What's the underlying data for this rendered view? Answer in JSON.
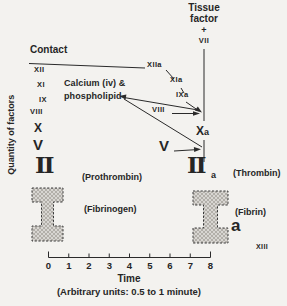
{
  "figure": {
    "y_axis_label": "Quantity of factors",
    "contact_label": "Contact",
    "tissue_factor": {
      "line1": "Tissue",
      "line2": "factor",
      "plus": "+",
      "factor": "VII"
    },
    "cofactor": {
      "line1": "Calcium (iv) &",
      "line2": "phospholipid"
    },
    "left_factors": {
      "xii": "XII",
      "xi": "XI",
      "ix": "IX",
      "viii": "VIII",
      "x": "X",
      "v": "V",
      "ii": "II"
    },
    "right_factors": {
      "xiia": "XIIa",
      "xia": "XIa",
      "ixa": "IXa",
      "viii": "VIII",
      "xa_main": "X",
      "xa_sub": "a",
      "v": "V",
      "iia_main": "II",
      "iia_sub": "a"
    },
    "annotations": {
      "prothrombin": "(Prothrombin)",
      "fibrinogen": "(Fibrinogen)",
      "thrombin": "(Thrombin)",
      "fibrin": "(Fibrin)",
      "fibrin_subscript": "a",
      "xiii": "XIII"
    },
    "x_axis": {
      "ticks": [
        "0",
        "1",
        "2",
        "3",
        "4",
        "5",
        "6",
        "7",
        "8"
      ],
      "label": "Time",
      "sublabel": "(Arbitrary units: 0.5 to 1 minute)"
    }
  },
  "colors": {
    "ink": "#2a2a2a",
    "background": "#f3f2ef",
    "beam_fill": "#d8d6d2",
    "beam_hatch": "#a29e98"
  }
}
